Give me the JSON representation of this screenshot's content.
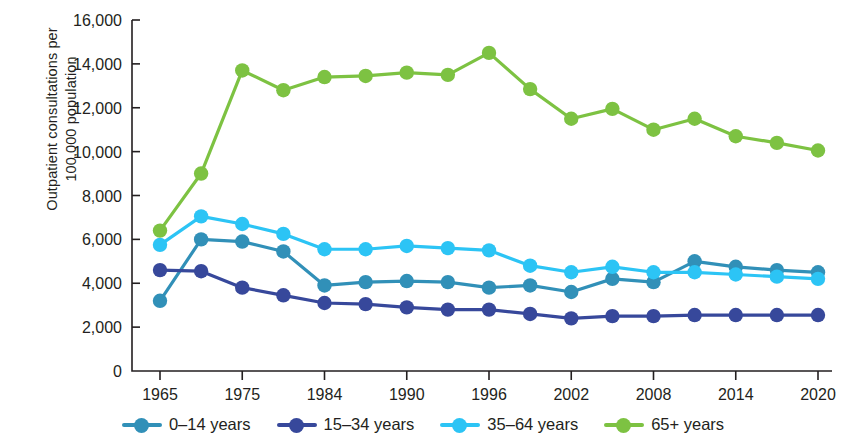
{
  "chart_data": {
    "type": "line",
    "title": "",
    "xlabel": "",
    "ylabel": "Outpatient consultations per\n100,000 population",
    "ylabel_line1": "Outpatient consultations per",
    "ylabel_line2": "100,000 population",
    "ylim": [
      0,
      16000
    ],
    "ytick_values": [
      0,
      2000,
      4000,
      6000,
      8000,
      10000,
      12000,
      14000,
      16000
    ],
    "ytick_labels": [
      "0",
      "2,000",
      "4,000",
      "6,000",
      "8,000",
      "10,000",
      "12,000",
      "14,000",
      "16,000"
    ],
    "grid": false,
    "legend_position": "bottom",
    "x": [
      1965,
      1970,
      1975,
      1980,
      1984,
      1987,
      1990,
      1993,
      1996,
      1999,
      2002,
      2005,
      2008,
      2011,
      2014,
      2017,
      2020
    ],
    "xtick_indices": [
      0,
      2,
      4,
      6,
      8,
      10,
      12,
      14,
      16
    ],
    "xtick_labels": [
      "1965",
      "1975",
      "1984",
      "1990",
      "1996",
      "2002",
      "2008",
      "2014",
      "2020"
    ],
    "series": [
      {
        "name": "0–14 years",
        "color": "#3190b8",
        "values": [
          3200,
          6000,
          5900,
          5450,
          3900,
          4050,
          4100,
          4050,
          3800,
          3900,
          3600,
          4200,
          4050,
          5000,
          4750,
          4600,
          4500
        ]
      },
      {
        "name": "15–34 years",
        "color": "#37489b",
        "values": [
          4600,
          4550,
          3800,
          3450,
          3100,
          3050,
          2900,
          2800,
          2800,
          2600,
          2400,
          2500,
          2500,
          2550,
          2550,
          2550,
          2550
        ]
      },
      {
        "name": "35–64 years",
        "color": "#2cc4f5",
        "values": [
          5750,
          7050,
          6700,
          6250,
          5550,
          5550,
          5700,
          5600,
          5500,
          4800,
          4500,
          4750,
          4500,
          4500,
          4400,
          4300,
          4200
        ]
      },
      {
        "name": "65+ years",
        "color": "#7dc242",
        "values": [
          6400,
          9000,
          13700,
          12800,
          13400,
          13450,
          13600,
          13500,
          14500,
          12850,
          11500,
          11950,
          11000,
          11500,
          10700,
          10400,
          10050
        ]
      }
    ]
  },
  "legend": {
    "items": [
      {
        "label": "0–14 years",
        "color": "#3190b8"
      },
      {
        "label": "15–34 years",
        "color": "#37489b"
      },
      {
        "label": "35–64 years",
        "color": "#2cc4f5"
      },
      {
        "label": "65+ years",
        "color": "#7dc242"
      }
    ]
  },
  "axis": {
    "color": "#231f20"
  }
}
